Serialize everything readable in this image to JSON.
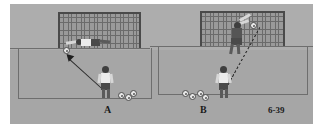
{
  "figure": {
    "number_label": "6-39",
    "panels": [
      {
        "id": "A",
        "caption": "A",
        "description": "Goalkeeper diving low across the goalmouth to save a shot",
        "keeper_action": "diving-save",
        "shot_line_style": "solid-arrow",
        "ball_count": 3
      },
      {
        "id": "B",
        "caption": "B",
        "description": "Goalkeeper leaping high with arms extended to tip the ball over the bar",
        "keeper_action": "leaping-high-save",
        "shot_line_style": "dashed",
        "ball_count": 4
      }
    ]
  },
  "colors": {
    "plate_background": "#a8a8a8",
    "pitch_back": "#adadad",
    "pitch_front": "#a6a6a6",
    "line": "#6e6e6e",
    "goal_post": "#4a4a4a",
    "net": "#9a9a9a",
    "jersey_light": "#ececec",
    "shorts_dark": "#4a4a4a",
    "ball_fill": "#e8e8e8",
    "trajectory": "#262626",
    "caption_text": "#1b1b1b",
    "page_background": "#ffffff"
  },
  "elements": {
    "goal_a_label": "goal-net-a",
    "goal_b_label": "goal-net-b",
    "keeper_a_label": "goalkeeper-diving",
    "keeper_b_label": "goalkeeper-leaping",
    "shooter_a_label": "shooter-front-view",
    "shooter_b_label": "shooter-rear-view"
  }
}
